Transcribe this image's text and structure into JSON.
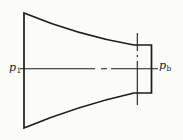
{
  "figure": {
    "labels": {
      "inlet": {
        "main": "p",
        "sub": "1"
      },
      "back": {
        "main": "p",
        "sub": "b"
      }
    },
    "colors": {
      "line": "#1c1c1c",
      "background": "#fbfbf8"
    }
  }
}
